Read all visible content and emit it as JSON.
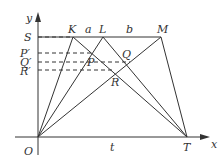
{
  "diagram": {
    "axes": {
      "x_label": "x",
      "y_label": "y",
      "origin_label": "O"
    },
    "points": {
      "S": "S",
      "K": "K",
      "L": "L",
      "M": "M",
      "T": "T",
      "P": "P",
      "Q": "Q",
      "R": "R",
      "P_prime": "P′",
      "Q_prime": "Q′",
      "R_prime": "R′"
    },
    "segment_labels": {
      "a": "a",
      "b": "b",
      "t": "t"
    },
    "colors": {
      "line": "#333333",
      "background": "#ffffff"
    }
  }
}
